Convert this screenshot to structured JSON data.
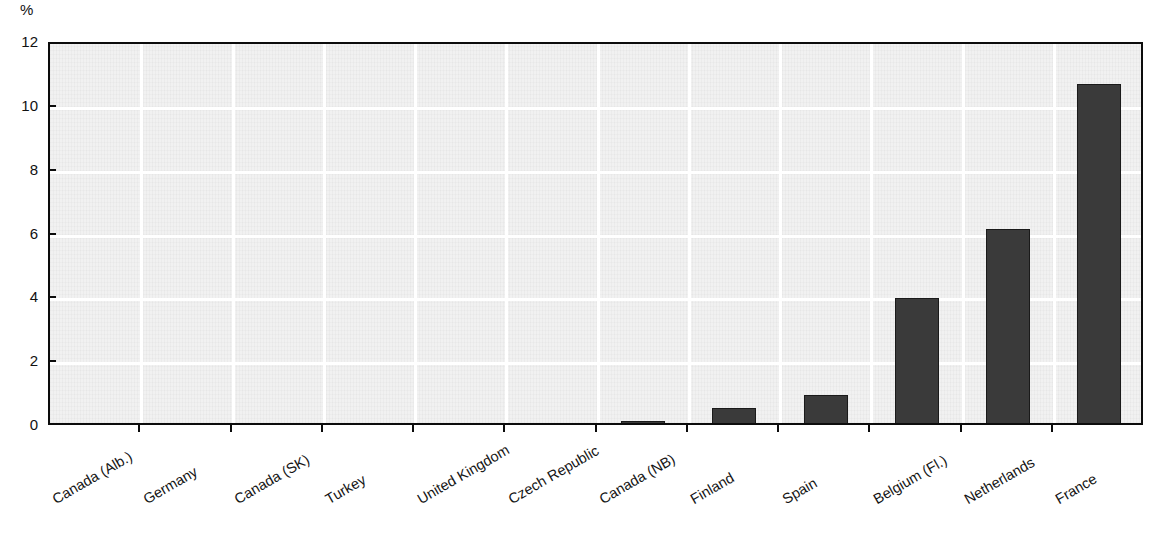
{
  "chart_data": {
    "type": "bar",
    "title": "",
    "subtitle": "",
    "xlabel": "",
    "ylabel": "%",
    "unit_label": "%",
    "categories": [
      "Canada (Alb.)",
      "Germany",
      "Canada (SK)",
      "Turkey",
      "United Kingdom",
      "Czech Republic",
      "Canada (NB)",
      "Finland",
      "Spain",
      "Belgium (Fl.)",
      "Netherlands",
      "France"
    ],
    "values": [
      0,
      0,
      0,
      0,
      0,
      0.1,
      0.2,
      0.6,
      1.0,
      4.05,
      6.2,
      10.75
    ],
    "ylim": [
      0,
      12
    ],
    "ytick_labels": [
      "0",
      "2",
      "4",
      "6",
      "8",
      "10",
      "12"
    ],
    "ytick_values": [
      0,
      2,
      4,
      6,
      8,
      10,
      12
    ],
    "grid": true,
    "grid_color": "#ffffff",
    "legend": "none",
    "bar_color": "#3a3a3a",
    "plot_background": "#f1f1f1",
    "axis_color": "#0c0c0c",
    "label_rotation_deg": -30
  }
}
